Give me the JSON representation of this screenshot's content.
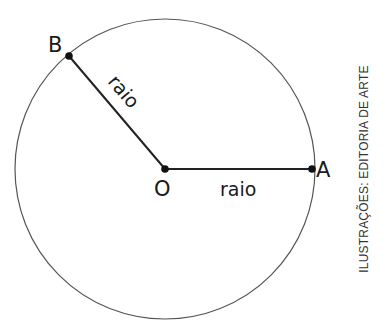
{
  "diagram": {
    "type": "circle-radius",
    "circle": {
      "cx": 165,
      "cy": 169,
      "r": 150,
      "stroke": "#555555"
    },
    "points": [
      {
        "id": "O",
        "label": "O",
        "x": 165,
        "y": 169
      },
      {
        "id": "A",
        "label": "A",
        "x": 312,
        "y": 169
      },
      {
        "id": "B",
        "label": "B",
        "x": 69,
        "y": 56
      }
    ],
    "segments": [
      {
        "from": "O",
        "to": "A",
        "label": "raio"
      },
      {
        "from": "O",
        "to": "B",
        "label": "raio"
      }
    ]
  },
  "labels": {
    "point_o": "O",
    "point_a": "A",
    "point_b": "B",
    "radius_oa": "raio",
    "radius_ob": "raio"
  },
  "credit": "ILUSTRAÇÕES: EDITORIA DE ARTE"
}
